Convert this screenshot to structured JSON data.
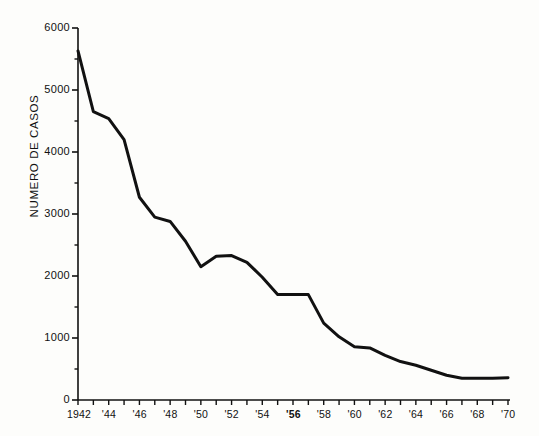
{
  "chart_data": {
    "type": "line",
    "title": "",
    "subtitle": "",
    "xlabel": "",
    "ylabel": "NUMERO DE CASOS",
    "xlim": [
      1942,
      1970
    ],
    "ylim": [
      0,
      6000
    ],
    "grid": false,
    "legend": null,
    "y_ticks_major": [
      0,
      1000,
      2000,
      3000,
      4000,
      5000,
      6000
    ],
    "y_ticks_major_labels": [
      "0",
      "1000",
      "2000",
      "3000",
      "4000",
      "5000",
      "6000"
    ],
    "y_ticks_minor": [
      500,
      1500,
      2500,
      3500,
      4500,
      5500
    ],
    "x_ticks": [
      1942,
      1943,
      1944,
      1945,
      1946,
      1947,
      1948,
      1949,
      1950,
      1951,
      1952,
      1953,
      1954,
      1955,
      1956,
      1957,
      1958,
      1959,
      1960,
      1961,
      1962,
      1963,
      1964,
      1965,
      1966,
      1967,
      1968,
      1969,
      1970
    ],
    "x_tick_labels": [
      {
        "x": 1942,
        "label": "1942",
        "bold": false
      },
      {
        "x": 1944,
        "label": "'44",
        "bold": false
      },
      {
        "x": 1946,
        "label": "'46",
        "bold": false
      },
      {
        "x": 1948,
        "label": "'48",
        "bold": false
      },
      {
        "x": 1950,
        "label": "'50",
        "bold": false
      },
      {
        "x": 1952,
        "label": "'52",
        "bold": false
      },
      {
        "x": 1954,
        "label": "'54",
        "bold": false
      },
      {
        "x": 1956,
        "label": "'56",
        "bold": true
      },
      {
        "x": 1958,
        "label": "'58",
        "bold": false
      },
      {
        "x": 1960,
        "label": "'60",
        "bold": false
      },
      {
        "x": 1962,
        "label": "'62",
        "bold": false
      },
      {
        "x": 1964,
        "label": "'64",
        "bold": false
      },
      {
        "x": 1966,
        "label": "'66",
        "bold": false
      },
      {
        "x": 1968,
        "label": "'68",
        "bold": false
      },
      {
        "x": 1970,
        "label": "'70",
        "bold": false
      }
    ],
    "x": [
      1942,
      1943,
      1944,
      1945,
      1946,
      1947,
      1948,
      1949,
      1950,
      1951,
      1952,
      1953,
      1954,
      1955,
      1956,
      1957,
      1958,
      1959,
      1960,
      1961,
      1962,
      1963,
      1964,
      1965,
      1966,
      1967,
      1968,
      1969,
      1970
    ],
    "values": [
      5630,
      4650,
      4540,
      4200,
      3270,
      2950,
      2880,
      2560,
      2150,
      2320,
      2330,
      2220,
      1980,
      1700,
      1700,
      1700,
      1240,
      1020,
      860,
      840,
      720,
      620,
      560,
      480,
      400,
      350,
      350,
      350,
      360
    ],
    "line_color": "#111111",
    "line_width": 3,
    "background_color": "#fdfdfb"
  }
}
